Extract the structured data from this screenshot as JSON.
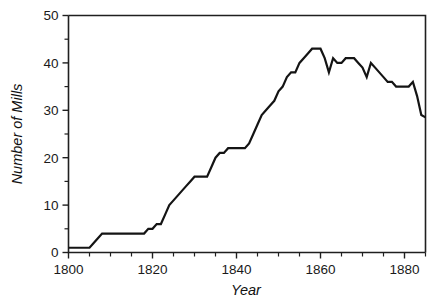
{
  "chart_data": {
    "type": "line",
    "title": "",
    "xlabel": "Year",
    "ylabel": "Number of Mills",
    "xlim": [
      1800,
      1885
    ],
    "ylim": [
      0,
      50
    ],
    "grid": false,
    "legend": null,
    "x_ticks": [
      1800,
      1820,
      1840,
      1860,
      1880
    ],
    "x_tick_labels": [
      "1800",
      "1820",
      "1840",
      "1860",
      "1880"
    ],
    "x_minor_tick_step": 5,
    "y_ticks": [
      0,
      10,
      20,
      30,
      40,
      50
    ],
    "y_tick_labels": [
      "0",
      "10",
      "20",
      "30",
      "40",
      "50"
    ],
    "y_minor_tick_step": 5,
    "series": [
      {
        "name": "Number of Mills",
        "color": "#141414",
        "x": [
          1800,
          1801,
          1802,
          1803,
          1804,
          1805,
          1806,
          1807,
          1808,
          1809,
          1810,
          1811,
          1812,
          1813,
          1814,
          1815,
          1816,
          1817,
          1818,
          1819,
          1820,
          1821,
          1822,
          1823,
          1824,
          1825,
          1826,
          1827,
          1828,
          1829,
          1830,
          1831,
          1832,
          1833,
          1834,
          1835,
          1836,
          1837,
          1838,
          1839,
          1840,
          1841,
          1842,
          1843,
          1844,
          1845,
          1846,
          1847,
          1848,
          1849,
          1850,
          1851,
          1852,
          1853,
          1854,
          1855,
          1856,
          1857,
          1858,
          1859,
          1860,
          1861,
          1862,
          1863,
          1864,
          1865,
          1866,
          1867,
          1868,
          1869,
          1870,
          1871,
          1872,
          1873,
          1874,
          1875,
          1876,
          1877,
          1878,
          1879,
          1880,
          1881,
          1882,
          1883,
          1884,
          1885
        ],
        "values": [
          1,
          1,
          1,
          1,
          1,
          1,
          2,
          3,
          4,
          4,
          4,
          4,
          4,
          4,
          4,
          4,
          4,
          4,
          4,
          5,
          5,
          6,
          6,
          8,
          10,
          11,
          12,
          13,
          14,
          15,
          16,
          16,
          16,
          16,
          18,
          20,
          21,
          21,
          22,
          22,
          22,
          22,
          22,
          23,
          25,
          27,
          29,
          30,
          31,
          32,
          34,
          35,
          37,
          38,
          38,
          40,
          41,
          42,
          43,
          43,
          43,
          41,
          38,
          41,
          40,
          40,
          41,
          41,
          41,
          40,
          39,
          37,
          40,
          39,
          38,
          37,
          36,
          36,
          35,
          35,
          35,
          35,
          36,
          33,
          29,
          28.5
        ]
      }
    ]
  },
  "axis_titles": {
    "y": "Number of Mills",
    "x": "Year"
  }
}
